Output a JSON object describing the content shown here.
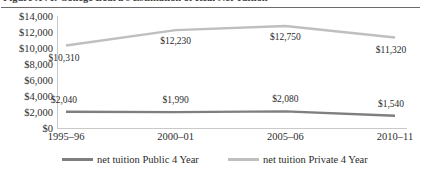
{
  "figure": {
    "title": "Figure XVI: College Board's Estimation of Real Net Tuition"
  },
  "chart_data": {
    "type": "line",
    "title": "Figure XVI: College Board's Estimation of Real Net Tuition",
    "xlabel": "",
    "ylabel": "",
    "categories": [
      "1995–96",
      "2000–01",
      "2005–06",
      "2010–11"
    ],
    "ylim": [
      0,
      14000
    ],
    "ytick_labels": [
      "$14,000",
      "$12,000",
      "$10,000",
      "$8,000",
      "$6,000",
      "$4,000",
      "$2,000",
      "$0"
    ],
    "ytick_values": [
      14000,
      12000,
      10000,
      8000,
      6000,
      4000,
      2000,
      0
    ],
    "grid": false,
    "legend_position": "bottom",
    "series": [
      {
        "name": "net tuition Public 4 Year",
        "color": "#7f7f7f",
        "values": [
          2040,
          1990,
          2080,
          1540
        ],
        "value_labels": [
          "$2,040",
          "$1,990",
          "$2,080",
          "$1,540"
        ]
      },
      {
        "name": "net tuition Private 4 Year",
        "color": "#bfbfbf",
        "values": [
          10310,
          12230,
          12750,
          11320
        ],
        "value_labels": [
          "$10,310",
          "$12,230",
          "$12,750",
          "$11,320"
        ]
      }
    ]
  },
  "legend": {
    "items": [
      {
        "label": "net tuition Public 4 Year",
        "color": "#7f7f7f"
      },
      {
        "label": "net tuition Private 4 Year",
        "color": "#bfbfbf"
      }
    ]
  },
  "colors": {
    "public_series": "#7f7f7f",
    "private_series": "#bfbfbf",
    "axis": "#c9c9c9",
    "title_rule": "#6b6b6b",
    "text": "#2e2e2e"
  }
}
